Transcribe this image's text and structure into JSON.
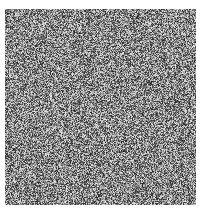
{
  "image": {
    "description": "grayscale random noise square",
    "background": "#ffffff",
    "region": {
      "x": 5,
      "y": 9,
      "width": 191,
      "height": 196
    },
    "pixel_size": 1,
    "gray_range": [
      40,
      230
    ],
    "seed": 1337
  }
}
